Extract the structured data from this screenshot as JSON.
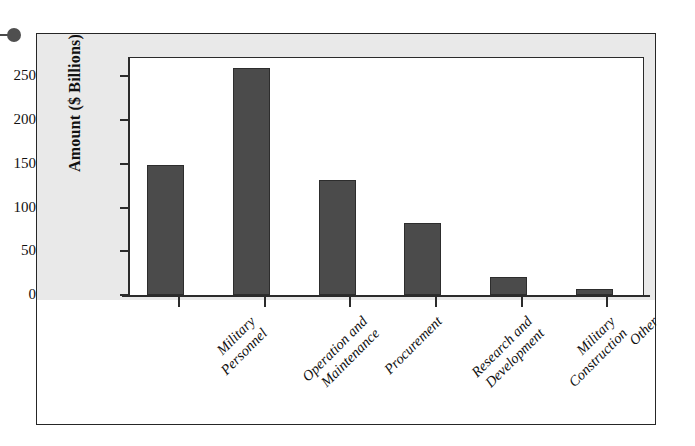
{
  "figure": {
    "bullet_marker": "bullet-dot-marker",
    "background_color": "#e9e9e9",
    "frame_color": "#262626",
    "bar_color": "#4b4b4b"
  },
  "chart_data": {
    "type": "bar",
    "title": "",
    "xlabel": "",
    "ylabel": "Amount ($ Billions)",
    "categories": [
      "Military Personnel",
      "Operation and Maintenance",
      "Procurement",
      "Research and Development",
      "Military Construction",
      "Other"
    ],
    "category_lines": [
      [
        "Military",
        "Personnel"
      ],
      [
        "Operation and",
        "Maintenance"
      ],
      [
        "Procurement",
        ""
      ],
      [
        "Research and",
        "Development"
      ],
      [
        "Military",
        "Construction"
      ],
      [
        "Other",
        ""
      ]
    ],
    "values": [
      149,
      260,
      132,
      82,
      21,
      7
    ],
    "ylim": [
      0,
      272
    ],
    "yticks": [
      0,
      50,
      100,
      150,
      200,
      250
    ],
    "ytick_labels": [
      "0",
      "50",
      "100",
      "150",
      "200",
      "250"
    ],
    "grid": false,
    "legend": null,
    "orientation": "vertical",
    "label_rotation_degrees": 45
  }
}
